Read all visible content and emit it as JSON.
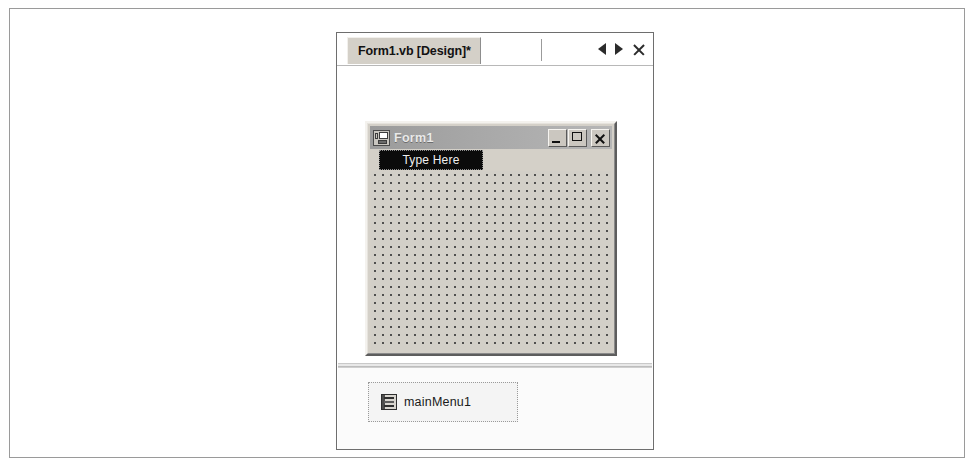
{
  "window": {
    "tab": {
      "label": "Form1.vb [Design]*",
      "nav_prev_icon": "triangle-left-icon",
      "nav_next_icon": "triangle-right-icon",
      "close_icon": "close-x-icon"
    }
  },
  "design_surface": {
    "form": {
      "icon": "form-window-icon",
      "title": "Form1",
      "window_buttons": {
        "minimize": "minimize-icon",
        "maximize": "maximize-icon",
        "close": "close-icon"
      },
      "menu": {
        "type_here_label": "Type Here",
        "selected": true
      }
    }
  },
  "component_tray": {
    "items": [
      {
        "icon": "main-menu-icon",
        "label": "mainMenu1",
        "selected": true
      }
    ]
  },
  "colors": {
    "tab_background": "#d4d0c8",
    "form_face": "#d4d0c8",
    "titlebar_inactive": "#a8a8a8",
    "menu_selected_background": "#0b0b0b",
    "menu_selected_text": "#f0f0f0",
    "grid_dot": "#4f4f4f"
  }
}
